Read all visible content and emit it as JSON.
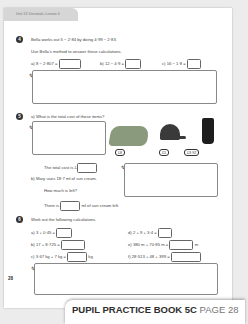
{
  "header": {
    "unit_label": "Unit 13: Decimals, Lesson 4"
  },
  "q4": {
    "number": "4",
    "intro": "Bella works out 5 − 2·84 by doing 4·99 − 2·83.",
    "instruction": "Use Bella's method to answer these calculations.",
    "parts": [
      {
        "label": "a)",
        "text": "8 − 2·807 ="
      },
      {
        "label": "b)",
        "text": "12 − 4·9 ="
      },
      {
        "label": "c)",
        "text": "16 − 1·8 ="
      }
    ]
  },
  "q5": {
    "number": "5",
    "a_label": "a)",
    "a_text": "What is the total cost of these items?",
    "prices": [
      "£8",
      "£5",
      "£3·92"
    ],
    "total_text": "The total cost is £",
    "b_label": "b)",
    "b_text": "Mary uses 18·7 ml of sun cream.",
    "b_question": "How much is left?",
    "b_answer_pre": "There is",
    "b_answer_post": "ml of sun cream left."
  },
  "q6": {
    "number": "6",
    "instruction": "Work out the following calculations.",
    "parts": [
      {
        "label": "a)",
        "text": "3 + 0·45 =",
        "unit": ""
      },
      {
        "label": "b)",
        "text": "17 + 8·725 =",
        "unit": ""
      },
      {
        "label": "c)",
        "text": "3·67 kg + 7 kg =",
        "unit": "kg"
      },
      {
        "label": "d)",
        "text": "2 + 9 + 3·4 =",
        "unit": ""
      },
      {
        "label": "e)",
        "text": "380 m + 70·85 m =",
        "unit": "m"
      },
      {
        "label": "f)",
        "text": "28·513 + 48 + 399 =",
        "unit": ""
      }
    ]
  },
  "footer": {
    "page_number": "28"
  },
  "banner": {
    "book": "PUPIL PRACTICE BOOK 5C",
    "page": "PAGE 28"
  }
}
